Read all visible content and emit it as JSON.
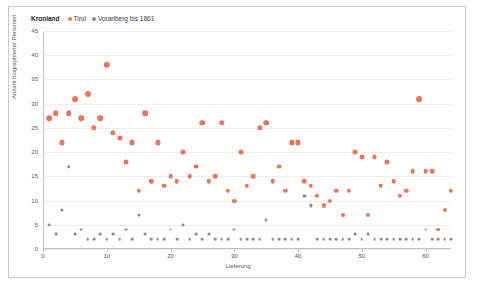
{
  "legend": {
    "title": "Kronland",
    "entries": [
      {
        "label": "Tirol",
        "color": "#e8765a"
      },
      {
        "label": "Vorarlberg bis 1861",
        "color": "#8a8d8f"
      }
    ]
  },
  "chart_data": {
    "type": "scatter",
    "title": "",
    "xlabel": "Lieferung",
    "ylabel": "Anzahl biographierter Personen",
    "xlim": [
      0,
      64
    ],
    "ylim": [
      0,
      45
    ],
    "grid": true,
    "legend_position": "top-left",
    "yticks": [
      0,
      5,
      10,
      15,
      20,
      25,
      30,
      35,
      40,
      45
    ],
    "xticks": [
      0,
      10,
      20,
      30,
      40,
      50,
      60
    ],
    "series": [
      {
        "name": "Tirol",
        "color": "#e8765a",
        "points": [
          [
            1,
            27
          ],
          [
            2,
            28
          ],
          [
            3,
            22
          ],
          [
            4,
            28
          ],
          [
            5,
            31
          ],
          [
            6,
            27
          ],
          [
            7,
            32
          ],
          [
            8,
            25
          ],
          [
            9,
            27
          ],
          [
            10,
            38
          ],
          [
            11,
            24
          ],
          [
            12,
            23
          ],
          [
            13,
            18
          ],
          [
            14,
            22
          ],
          [
            15,
            12
          ],
          [
            16,
            28
          ],
          [
            17,
            14
          ],
          [
            18,
            22
          ],
          [
            19,
            13
          ],
          [
            20,
            15
          ],
          [
            21,
            14
          ],
          [
            22,
            20
          ],
          [
            23,
            15
          ],
          [
            24,
            17
          ],
          [
            25,
            26
          ],
          [
            26,
            14
          ],
          [
            27,
            15
          ],
          [
            28,
            26
          ],
          [
            29,
            12
          ],
          [
            30,
            10
          ],
          [
            31,
            20
          ],
          [
            32,
            13
          ],
          [
            33,
            15
          ],
          [
            34,
            25
          ],
          [
            35,
            26
          ],
          [
            36,
            14
          ],
          [
            37,
            17
          ],
          [
            38,
            12
          ],
          [
            39,
            22
          ],
          [
            40,
            22
          ],
          [
            41,
            14
          ],
          [
            42,
            13
          ],
          [
            43,
            11
          ],
          [
            44,
            9
          ],
          [
            45,
            10
          ],
          [
            46,
            12
          ],
          [
            47,
            7
          ],
          [
            48,
            12
          ],
          [
            49,
            20
          ],
          [
            50,
            19
          ],
          [
            51,
            7
          ],
          [
            52,
            19
          ],
          [
            53,
            13
          ],
          [
            54,
            18
          ],
          [
            55,
            14
          ],
          [
            56,
            11
          ],
          [
            57,
            12
          ],
          [
            58,
            16
          ],
          [
            59,
            31
          ],
          [
            60,
            16
          ],
          [
            61,
            16
          ],
          [
            62,
            4
          ],
          [
            63,
            8
          ],
          [
            64,
            12
          ]
        ]
      },
      {
        "name": "Vorarlberg bis 1861",
        "color": "#8a8d8f",
        "points": [
          [
            1,
            5
          ],
          [
            2,
            3
          ],
          [
            3,
            8
          ],
          [
            4,
            17
          ],
          [
            5,
            3
          ],
          [
            6,
            4
          ],
          [
            7,
            2
          ],
          [
            8,
            2
          ],
          [
            9,
            3
          ],
          [
            10,
            2
          ],
          [
            11,
            3
          ],
          [
            12,
            2
          ],
          [
            13,
            4
          ],
          [
            14,
            2
          ],
          [
            15,
            7
          ],
          [
            16,
            3
          ],
          [
            17,
            2
          ],
          [
            18,
            2
          ],
          [
            19,
            2
          ],
          [
            20,
            4
          ],
          [
            21,
            2
          ],
          [
            22,
            5
          ],
          [
            23,
            2
          ],
          [
            24,
            3
          ],
          [
            25,
            2
          ],
          [
            26,
            3
          ],
          [
            27,
            2
          ],
          [
            28,
            2
          ],
          [
            29,
            2
          ],
          [
            30,
            4
          ],
          [
            31,
            2
          ],
          [
            32,
            2
          ],
          [
            33,
            2
          ],
          [
            34,
            2
          ],
          [
            35,
            6
          ],
          [
            36,
            2
          ],
          [
            37,
            2
          ],
          [
            38,
            2
          ],
          [
            39,
            2
          ],
          [
            40,
            2
          ],
          [
            41,
            11
          ],
          [
            42,
            9
          ],
          [
            43,
            2
          ],
          [
            44,
            2
          ],
          [
            45,
            2
          ],
          [
            46,
            2
          ],
          [
            47,
            2
          ],
          [
            48,
            2
          ],
          [
            49,
            3
          ],
          [
            50,
            2
          ],
          [
            51,
            3
          ],
          [
            52,
            2
          ],
          [
            53,
            2
          ],
          [
            54,
            2
          ],
          [
            55,
            2
          ],
          [
            56,
            2
          ],
          [
            57,
            2
          ],
          [
            58,
            2
          ],
          [
            59,
            2
          ],
          [
            60,
            4
          ],
          [
            61,
            2
          ],
          [
            62,
            2
          ],
          [
            63,
            2
          ],
          [
            64,
            2
          ]
        ]
      }
    ]
  }
}
